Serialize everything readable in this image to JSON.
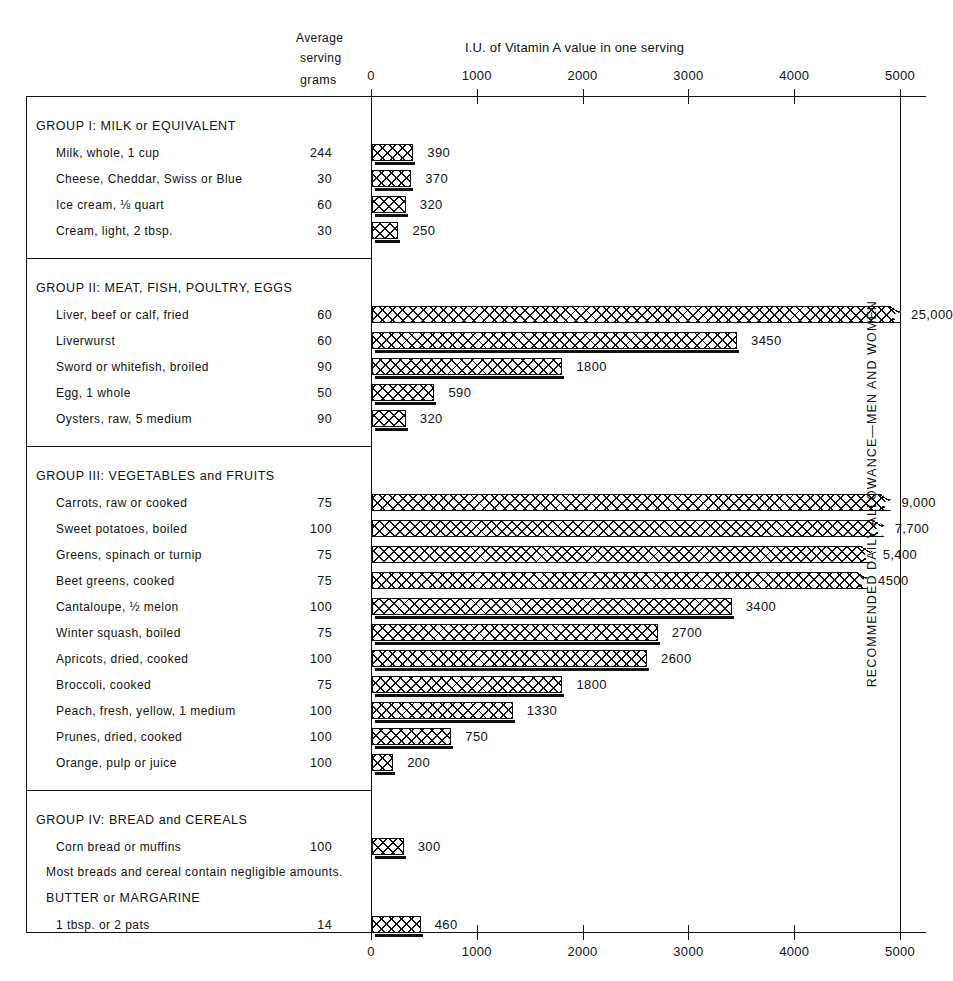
{
  "header": {
    "avg_line1": "Average",
    "avg_line2": "serving",
    "grams": "grams",
    "chart_title": "I.U. of Vitamin A value in one serving"
  },
  "right_axis_label": "RECOMMENDED DAILY ALLOWANCE—MEN AND WOMEN",
  "axis": {
    "ticks": [
      "0",
      "1000",
      "2000",
      "3000",
      "4000",
      "5000"
    ],
    "tick_values": [
      0,
      1000,
      2000,
      3000,
      4000,
      5000
    ]
  },
  "groups": [
    {
      "title": "GROUP I:  MILK  or  EQUIVALENT",
      "items": [
        {
          "name": "Milk, whole, 1 cup",
          "grams": "244",
          "value": 390,
          "label": "390",
          "truncated": false
        },
        {
          "name": "Cheese, Cheddar, Swiss or Blue",
          "grams": "30",
          "value": 370,
          "label": "370",
          "truncated": false
        },
        {
          "name": "Ice cream, ⅛ quart",
          "grams": "60",
          "value": 320,
          "label": "320",
          "truncated": false
        },
        {
          "name": "Cream, light, 2 tbsp.",
          "grams": "30",
          "value": 250,
          "label": "250",
          "truncated": false
        }
      ]
    },
    {
      "title": "GROUP II:  MEAT,  FISH,  POULTRY,  EGGS",
      "items": [
        {
          "name": "Liver, beef or calf, fried",
          "grams": "60",
          "value": 25000,
          "label": "25,000",
          "truncated": true
        },
        {
          "name": "Liverwurst",
          "grams": "60",
          "value": 3450,
          "label": "3450",
          "truncated": false
        },
        {
          "name": "Sword or whitefish, broiled",
          "grams": "90",
          "value": 1800,
          "label": "1800",
          "truncated": false
        },
        {
          "name": "Egg, 1 whole",
          "grams": "50",
          "value": 590,
          "label": "590",
          "truncated": false
        },
        {
          "name": "Oysters, raw, 5 medium",
          "grams": "90",
          "value": 320,
          "label": "320",
          "truncated": false
        }
      ]
    },
    {
      "title": "GROUP  III:  VEGETABLES  and  FRUITS",
      "items": [
        {
          "name": "Carrots, raw or cooked",
          "grams": "75",
          "value": 9000,
          "label": "9,000",
          "truncated": true
        },
        {
          "name": "Sweet potatoes, boiled",
          "grams": "100",
          "value": 7700,
          "label": "7,700",
          "truncated": true
        },
        {
          "name": "Greens, spinach or turnip",
          "grams": "75",
          "value": 5400,
          "label": "5,400",
          "truncated": true
        },
        {
          "name": "Beet greens, cooked",
          "grams": "75",
          "value": 4500,
          "label": "4500",
          "truncated": true
        },
        {
          "name": "Cantaloupe, ½ melon",
          "grams": "100",
          "value": 3400,
          "label": "3400",
          "truncated": false
        },
        {
          "name": "Winter squash, boiled",
          "grams": "75",
          "value": 2700,
          "label": "2700",
          "truncated": false
        },
        {
          "name": "Apricots, dried, cooked",
          "grams": "100",
          "value": 2600,
          "label": "2600",
          "truncated": false
        },
        {
          "name": "Broccoli, cooked",
          "grams": "75",
          "value": 1800,
          "label": "1800",
          "truncated": false
        },
        {
          "name": "Peach, fresh, yellow, 1 medium",
          "grams": "100",
          "value": 1330,
          "label": "1330",
          "truncated": false
        },
        {
          "name": "Prunes, dried, cooked",
          "grams": "100",
          "value": 750,
          "label": "750",
          "truncated": false
        },
        {
          "name": "Orange, pulp or juice",
          "grams": "100",
          "value": 200,
          "label": "200",
          "truncated": false
        }
      ]
    },
    {
      "title": "GROUP IV:  BREAD and  CEREALS",
      "items": [
        {
          "name": "Corn bread or muffins",
          "grams": "100",
          "value": 300,
          "label": "300",
          "truncated": false
        }
      ],
      "note": "Most breads and cereal contain negligible amounts.",
      "subtitle": "BUTTER  or  MARGARINE",
      "sub_items": [
        {
          "name": "1  tbsp. or 2 pats",
          "grams": "14",
          "value": 460,
          "label": "460",
          "truncated": false
        }
      ]
    }
  ],
  "chart_data": {
    "type": "bar",
    "orientation": "horizontal",
    "title": "I.U. of Vitamin A value in one serving",
    "xlabel": "I.U. of Vitamin A value in one serving",
    "ylabel": "",
    "xlim": [
      0,
      5000
    ],
    "xticks": [
      0,
      1000,
      2000,
      3000,
      4000,
      5000
    ],
    "grid": false,
    "legend": null,
    "annotations": [
      "RECOMMENDED DAILY ALLOWANCE—MEN AND WOMEN at 5000 I.U.",
      "Bars with notched ends are truncated: actual value exceeds 5000 I.U."
    ],
    "categories": [
      "Milk, whole, 1 cup",
      "Cheese, Cheddar, Swiss or Blue",
      "Ice cream, 1/8 quart",
      "Cream, light, 2 tbsp.",
      "Liver, beef or calf, fried",
      "Liverwurst",
      "Sword or whitefish, broiled",
      "Egg, 1 whole",
      "Oysters, raw, 5 medium",
      "Carrots, raw or cooked",
      "Sweet potatoes, boiled",
      "Greens, spinach or turnip",
      "Beet greens, cooked",
      "Cantaloupe, 1/2 melon",
      "Winter squash, boiled",
      "Apricots, dried, cooked",
      "Broccoli, cooked",
      "Peach, fresh, yellow, 1 medium",
      "Prunes, dried, cooked",
      "Orange, pulp or juice",
      "Corn bread or muffins",
      "1 tbsp. or 2 pats"
    ],
    "values": [
      390,
      370,
      320,
      250,
      25000,
      3450,
      1800,
      590,
      320,
      9000,
      7700,
      5400,
      4500,
      3400,
      2700,
      2600,
      1800,
      1330,
      750,
      200,
      300,
      460
    ],
    "serving_grams": [
      244,
      30,
      60,
      30,
      60,
      60,
      90,
      50,
      90,
      75,
      100,
      75,
      75,
      100,
      75,
      100,
      75,
      100,
      100,
      100,
      100,
      14
    ]
  }
}
